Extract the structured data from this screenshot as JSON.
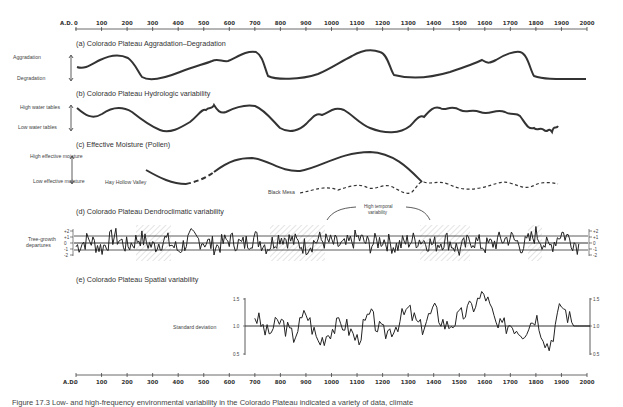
{
  "figure": {
    "caption": "Figure 17.3 Low- and high-frequency environmental variability in the Colorado Plateau indicated a variety of data, climate"
  },
  "axis": {
    "prefix": "A.D.",
    "ticks": [
      "0",
      "100",
      "200",
      "300",
      "400",
      "500",
      "600",
      "700",
      "800",
      "900",
      "1000",
      "1100",
      "1200",
      "1300",
      "1400",
      "1500",
      "1600",
      "1700",
      "1800",
      "1900",
      "2000"
    ]
  },
  "panels": {
    "a": {
      "title": "(a) Colorado Plateau Aggradation–Degradation",
      "high": "Aggradation",
      "low": "Degradation"
    },
    "b": {
      "title": "(b) Colorado Plateau Hydrologic variability",
      "high": "High water tables",
      "low": "Low water tables"
    },
    "c": {
      "title": "(c) Effective Moisture (Pollen)",
      "high": "High effective moisture",
      "low": "Low effective moisture",
      "series1": "Hay Hollow Valley",
      "series2": "Black Mesa"
    },
    "d": {
      "title": "(d) Colorado Plateau Dendroclimatic variability",
      "ylabel": "Tree-growth departures",
      "annotation": "High temporal variability",
      "yticks": [
        "+2",
        "+1",
        "0",
        "-1",
        "-2"
      ]
    },
    "e": {
      "title": "(e) Colorado Plateau Spatial variability",
      "ylabel": "Standard deviation",
      "yticks": [
        "1.5",
        "1.0",
        "0.5"
      ]
    }
  },
  "chart_data": [
    {
      "type": "line",
      "title": "(a) Colorado Plateau Aggradation–Degradation",
      "xlabel": "A.D.",
      "ylabel": "Aggradation / Degradation (relative)",
      "x": [
        0,
        100,
        200,
        250,
        300,
        400,
        500,
        600,
        700,
        750,
        800,
        900,
        1000,
        1100,
        1200,
        1250,
        1300,
        1400,
        1500,
        1600,
        1700,
        1800,
        1850,
        1900,
        1975
      ],
      "values": [
        0.6,
        0.65,
        0.95,
        0.9,
        0.1,
        0.05,
        0.3,
        0.5,
        0.9,
        0.85,
        0.15,
        0.1,
        0.7,
        0.9,
        0.9,
        0.85,
        0.2,
        0.2,
        0.4,
        0.55,
        0.45,
        0.9,
        0.85,
        0.15,
        0.1
      ],
      "ylim": [
        0,
        1
      ]
    },
    {
      "type": "line",
      "title": "(b) Colorado Plateau Hydrologic variability",
      "xlabel": "A.D.",
      "ylabel": "High / Low water tables (relative)",
      "x": [
        0,
        100,
        200,
        300,
        400,
        500,
        600,
        700,
        800,
        900,
        1000,
        1100,
        1200,
        1300,
        1400,
        1500,
        1600,
        1700,
        1800,
        1900,
        1975
      ],
      "values": [
        0.8,
        0.5,
        0.7,
        0.3,
        0.1,
        0.5,
        0.75,
        0.8,
        0.3,
        0.1,
        0.5,
        0.7,
        0.65,
        0.4,
        0.2,
        0.7,
        0.8,
        0.6,
        0.7,
        0.1,
        0.2
      ],
      "ylim": [
        0,
        1
      ]
    },
    {
      "type": "line",
      "title": "(c) Effective Moisture (Pollen)",
      "xlabel": "A.D.",
      "ylabel": "Effective moisture (relative)",
      "series": [
        {
          "name": "Hay Hollow Valley",
          "x": [
            400,
            500,
            600,
            700,
            800,
            900,
            1000,
            1100,
            1200,
            1300,
            1350
          ],
          "values": [
            0.45,
            0.25,
            0.3,
            0.75,
            0.9,
            0.8,
            0.7,
            0.8,
            0.85,
            0.65,
            0.35
          ]
        },
        {
          "name": "Black Mesa",
          "x": [
            800,
            900,
            1000,
            1100,
            1200,
            1300,
            1400,
            1500,
            1600,
            1700,
            1800,
            1900
          ],
          "values": [
            0.2,
            0.25,
            0.3,
            0.2,
            0.25,
            0.1,
            0.35,
            0.2,
            0.2,
            0.3,
            0.25,
            0.3
          ]
        }
      ],
      "ylim": [
        0,
        1
      ]
    },
    {
      "type": "line",
      "title": "(d) Colorado Plateau Dendroclimatic variability",
      "xlabel": "A.D.",
      "ylabel": "Tree-growth departures",
      "x": [
        0,
        50,
        100,
        150,
        200,
        250,
        300,
        350,
        400,
        450,
        500,
        550,
        600,
        650,
        700,
        750,
        800,
        850,
        900,
        950,
        1000,
        1050,
        1100,
        1150,
        1200,
        1250,
        1300,
        1350,
        1400,
        1450,
        1500,
        1550,
        1600,
        1650,
        1700,
        1750,
        1800,
        1850,
        1900,
        1970
      ],
      "values": [
        -1,
        1,
        -1.5,
        2,
        -1,
        1.5,
        -1,
        1,
        -2,
        1.5,
        0.5,
        -1,
        1,
        -0.5,
        1.5,
        -1,
        2,
        0.5,
        -1,
        1,
        0,
        -1,
        1.5,
        -0.5,
        1,
        -1,
        0.5,
        1,
        -0.5,
        1,
        -2,
        1,
        -1,
        0.5,
        1.5,
        -1,
        2.5,
        -1.5,
        3,
        -1
      ],
      "ylim": [
        -2,
        2
      ],
      "annotations": [
        "High temporal variability"
      ],
      "shaded_periods": [
        [
          300,
          450
        ],
        [
          950,
          1020
        ],
        [
          1290,
          1420
        ],
        [
          1750,
          1800
        ]
      ]
    },
    {
      "type": "line",
      "title": "(e) Colorado Plateau Spatial variability",
      "xlabel": "A.D.",
      "ylabel": "Standard deviation",
      "x": [
        700,
        750,
        800,
        850,
        900,
        950,
        1000,
        1050,
        1100,
        1150,
        1200,
        1250,
        1300,
        1350,
        1400,
        1450,
        1500,
        1550,
        1600,
        1650,
        1700,
        1750,
        1800,
        1850,
        1900,
        1950,
        1970
      ],
      "values": [
        1.2,
        0.85,
        1.1,
        0.8,
        1.25,
        0.7,
        0.95,
        1.05,
        0.75,
        1.2,
        0.85,
        1.0,
        1.3,
        0.95,
        1.3,
        1.0,
        1.15,
        1.35,
        1.6,
        0.95,
        1.05,
        0.9,
        1.2,
        0.6,
        1.4,
        1.0,
        1.0
      ],
      "ylim": [
        0.5,
        1.5
      ]
    }
  ]
}
